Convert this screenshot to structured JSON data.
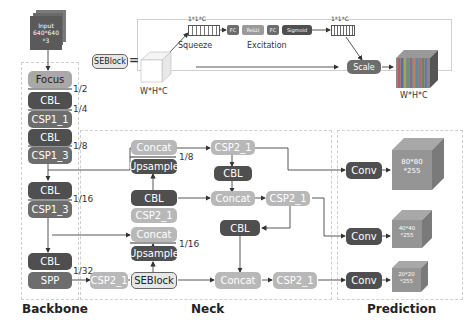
{
  "input": {
    "line1": "Input",
    "line2": "640*640",
    "line3": "*3"
  },
  "seblock_detail": {
    "label": "SEBlock",
    "equals": "=",
    "input_dims": "W*H*C",
    "squeeze_dims": "1*1*C",
    "squeeze_label": "Squeeze",
    "excitation_label": "Excitation",
    "fc1": "FC",
    "relu": "ReLU",
    "fc2": "FC",
    "sigmoid": "Sigmoid",
    "weights_dims": "1*1*C",
    "scale": "Scale",
    "output_dims": "W*H*C"
  },
  "backbone": {
    "title": "Backbone",
    "focus": "Focus",
    "cbl1": "CBL",
    "csp1_1": "CSP1_1",
    "cbl2": "CBL",
    "csp1_3a": "CSP1_3",
    "cbl3": "CBL",
    "csp1_3b": "CSP1_3",
    "cbl4": "CBL",
    "spp": "SPP",
    "scales": {
      "s2": "1/2",
      "s4": "1/4",
      "s8": "1/8",
      "s16": "1/16",
      "s32": "1/32"
    }
  },
  "neck": {
    "title": "Neck",
    "csp2_1_in": "CSP2_1",
    "seblock": "SEBlock",
    "upsample_low": "Upsample",
    "concat_low": "Concat",
    "scale_16": "1/16",
    "csp2_1_mid": "CSP2_1",
    "cbl_mid": "CBL",
    "upsample_high": "Upsample",
    "concat_high": "Concat",
    "scale_8": "1/8",
    "csp2_1_top": "CSP2_1",
    "cbl_top": "CBL",
    "concat_right_mid": "Concat",
    "csp2_1_right_mid": "CSP2_1",
    "cbl_right": "CBL",
    "concat_right_low": "Concat",
    "csp2_1_right_low": "CSP2_1"
  },
  "prediction": {
    "title": "Prediction",
    "conv1": "Conv",
    "conv2": "Conv",
    "conv3": "Conv",
    "out1": {
      "line1": "80*80",
      "line2": "*255"
    },
    "out2": {
      "line1": "40*40",
      "line2": "*255"
    },
    "out3": {
      "line1": "20*20",
      "line2": "*255"
    }
  }
}
